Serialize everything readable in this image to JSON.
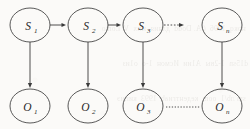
{
  "figure": {
    "name": "hidden-markov-model-trellis",
    "background_color": "#fbfaf8",
    "stroke_color": "#3b3b3b",
    "text_color": "#2a2a2a"
  },
  "hidden_states": [
    {
      "id": "s1",
      "base": "S",
      "sub": "1",
      "cx": 30,
      "cy": 25,
      "rx": 20,
      "ry": 17
    },
    {
      "id": "s2",
      "base": "S",
      "sub": "2",
      "cx": 88,
      "cy": 25,
      "rx": 20,
      "ry": 17
    },
    {
      "id": "s3",
      "base": "S",
      "sub": "3",
      "cx": 143,
      "cy": 25,
      "rx": 20,
      "ry": 17
    },
    {
      "id": "sn",
      "base": "S",
      "sub": "n",
      "cx": 222,
      "cy": 25,
      "rx": 20,
      "ry": 17
    }
  ],
  "observations": [
    {
      "id": "o1",
      "base": "O",
      "sub": "1",
      "cx": 30,
      "cy": 106,
      "rx": 20,
      "ry": 17
    },
    {
      "id": "o2",
      "base": "O",
      "sub": "2",
      "cx": 88,
      "cy": 106,
      "rx": 20,
      "ry": 17
    },
    {
      "id": "o3",
      "base": "O",
      "sub": "3",
      "cx": 143,
      "cy": 106,
      "rx": 20,
      "ry": 17
    },
    {
      "id": "on",
      "base": "O",
      "sub": "n",
      "cx": 222,
      "cy": 106,
      "rx": 20,
      "ry": 17
    }
  ],
  "transition_edges": [
    {
      "id": "s1-s2",
      "from": "s1",
      "to": "s2",
      "style": "solid",
      "arrow": true,
      "x1": 50,
      "y1": 25,
      "x2": 66,
      "y2": 25
    },
    {
      "id": "s2-s3",
      "from": "s2",
      "to": "s3",
      "style": "solid",
      "arrow": true,
      "x1": 108,
      "y1": 25,
      "x2": 121,
      "y2": 25
    },
    {
      "id": "s3-sn",
      "from": "s3",
      "to": "sn",
      "style": "dashed",
      "arrow": true,
      "x1": 164,
      "y1": 25,
      "x2": 198,
      "y2": 25
    }
  ],
  "emission_edges": [
    {
      "id": "s1-o1",
      "from": "s1",
      "to": "o1",
      "style": "solid",
      "arrow": true,
      "x1": 30,
      "y1": 42,
      "x2": 30,
      "y2": 87
    },
    {
      "id": "s2-o2",
      "from": "s2",
      "to": "o2",
      "style": "solid",
      "arrow": true,
      "x1": 88,
      "y1": 42,
      "x2": 88,
      "y2": 87
    },
    {
      "id": "s3-o3",
      "from": "s3",
      "to": "o3",
      "style": "solid",
      "arrow": true,
      "x1": 143,
      "y1": 42,
      "x2": 143,
      "y2": 87
    },
    {
      "id": "sn-on",
      "from": "sn",
      "to": "on",
      "style": "solid",
      "arrow": true,
      "x1": 222,
      "y1": 42,
      "x2": 222,
      "y2": 87
    }
  ],
  "continuation_edges": [
    {
      "id": "o3-on",
      "from": "o3",
      "to": "on",
      "style": "dotted",
      "arrow": false,
      "x1": 165,
      "y1": 107,
      "x2": 200,
      "y2": 107
    }
  ],
  "bleed_through_lines": [
    "  нокq  1996  ( A. Dodd  дляия  мих  V. Lomo",
    " d15sn  1-2вы  A1ии  Исмон  1-о  о1из",
    "  sm лb/1  oom  кедентгиаb  1993  кипиэ",
    "   ин  1 пномн  ог  оно  1 к  ниqп  оьооиг"
  ]
}
